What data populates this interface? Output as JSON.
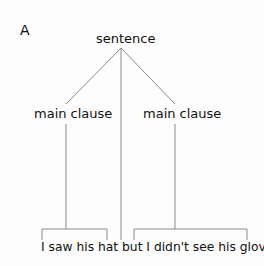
{
  "figure_label": "A",
  "tree": {
    "root": "sentence",
    "children": [
      "main clause",
      "main clause"
    ],
    "sentence_text": "I saw his hat but I didn't see his gloves.",
    "segments": {
      "clause1": "I saw his hat",
      "conjunction": "but",
      "clause2": "I didn't see his gloves."
    }
  },
  "colors": {
    "line": "#8a8a8a",
    "text": "#111111"
  }
}
